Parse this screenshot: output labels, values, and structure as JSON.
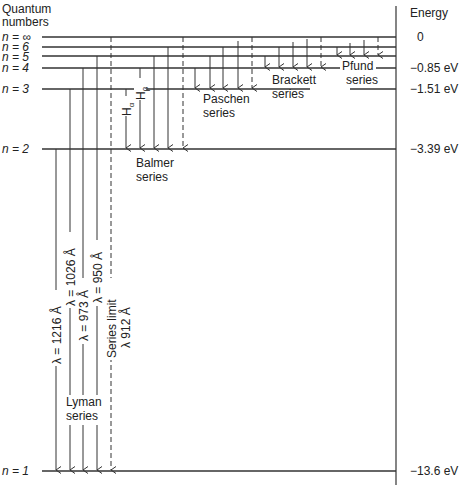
{
  "title_left": [
    "Quantum",
    "numbers"
  ],
  "title_right": "Energy",
  "levels": [
    {
      "label": "n = ∞",
      "y": 37,
      "energy": "0"
    },
    {
      "label": "n = 6",
      "y": 47,
      "energy": ""
    },
    {
      "label": "n = 5",
      "y": 56,
      "energy": ""
    },
    {
      "label": "n = 4",
      "y": 68,
      "energy": "−0.85 eV"
    },
    {
      "label": "n = 3",
      "y": 89,
      "energy": "−1.51 eV"
    },
    {
      "label": "n = 2",
      "y": 149,
      "energy": "−3.39 eV"
    },
    {
      "label": "n = 1",
      "y": 471,
      "energy": "−13.6 eV"
    }
  ],
  "series": [
    {
      "name": "Lyman",
      "label": [
        "Lyman",
        "series"
      ]
    },
    {
      "name": "Balmer",
      "label": [
        "Balmer",
        "series"
      ]
    },
    {
      "name": "Paschen",
      "label": [
        "Paschen",
        "series"
      ]
    },
    {
      "name": "Brackett",
      "label": [
        "Brackett",
        "series"
      ]
    },
    {
      "name": "Pfund",
      "label": [
        "Pfund",
        "series"
      ]
    }
  ],
  "lyman_wavelengths": [
    "λ = 1216 Å",
    "λ = 1026 Å",
    "λ = 973 Å",
    "λ = 950 Å"
  ],
  "series_limit": [
    "Series limit",
    "λ 912 Å"
  ],
  "balmer_lines": [
    "Hα",
    "Hβ"
  ]
}
